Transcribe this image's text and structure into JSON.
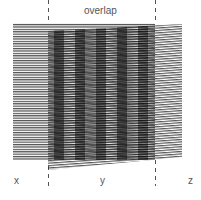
{
  "diagram": {
    "title": "overlap",
    "regions": [
      {
        "id": "x",
        "label": "x"
      },
      {
        "id": "y",
        "label": "y"
      },
      {
        "id": "z",
        "label": "z"
      }
    ],
    "grating_a": {
      "description": "horizontal line grating",
      "line_period_px": 2.4,
      "color": "#222222"
    },
    "grating_b": {
      "description": "slightly rotated line grating",
      "line_period_px": 2.4,
      "rotation_deg": -4,
      "color": "#222222"
    },
    "moire_fringes": 5,
    "divider_color": "#555555",
    "label_color": "#555555"
  }
}
